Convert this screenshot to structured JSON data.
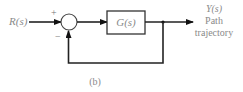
{
  "diagram": {
    "type": "feedback-control-block-diagram",
    "caption": "(b)",
    "input": {
      "label": "R(s)"
    },
    "summing_junction": {
      "plus_sign": "+",
      "minus_sign": "−"
    },
    "block": {
      "label": "G(s)"
    },
    "output": {
      "label": "Y(s)",
      "description_line1": "Path",
      "description_line2": "trajectory"
    },
    "feedback": "unity negative feedback",
    "colors": {
      "lines": "#222222",
      "text": "#8a8a8a"
    }
  }
}
